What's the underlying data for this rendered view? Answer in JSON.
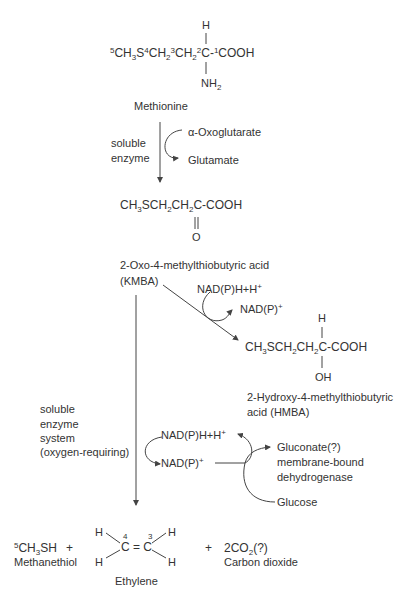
{
  "methionine": {
    "h_top": "H",
    "formula": {
      "l5": "5",
      "p1": "CH",
      "s3": "3",
      "p2": "S",
      "l4": "4",
      "p3": "CH",
      "s2a": "2",
      "l3": "3",
      "p4": "CH",
      "s2b": "2",
      "l2": "2",
      "p5": "C-",
      "l1": "1",
      "p6": "COOH"
    },
    "nh2": {
      "n": "NH",
      "sub": "2"
    },
    "name": "Methionine"
  },
  "step1": {
    "enzyme_line1": "soluble",
    "enzyme_line2": "enzyme",
    "cosubstrate_in": "α-Oxoglutarate",
    "cosubstrate_out": "Glutamate"
  },
  "kmba": {
    "formula": {
      "p1": "CH",
      "s3": "3",
      "p2": "SCH",
      "s2a": "2",
      "p3": "CH",
      "s2b": "2",
      "p4": "C-COOH"
    },
    "oxo": "O",
    "name_line1": "2-Oxo-4-methylthiobutyric acid",
    "name_line2": "(KMBA)"
  },
  "step2": {
    "cofactor_in": {
      "text": "NAD(P)H+H",
      "sup": "+"
    },
    "cofactor_out": {
      "text": "NAD(P)",
      "sup": "+"
    }
  },
  "hmba": {
    "h_top": "H",
    "formula": {
      "p1": "CH",
      "s3": "3",
      "p2": "SCH",
      "s2a": "2",
      "p3": "CH",
      "s2b": "2",
      "p4": "C-COOH"
    },
    "oh": "OH",
    "name_line1": "2-Hydroxy-4-methylthiobutyric",
    "name_line2": "acid (HMBA)"
  },
  "step3": {
    "enzyme_line1": "soluble",
    "enzyme_line2": "enzyme",
    "enzyme_line3": "system",
    "enzyme_line4": "(oxygen-requiring)",
    "cofactor_reduced": {
      "text": "NAD(P)H+H",
      "sup": "+"
    },
    "cofactor_oxidized": {
      "text": "NAD(P)",
      "sup": "+"
    },
    "gluconate": "Gluconate(?)",
    "dehydrogenase_line1": "membrane-bound",
    "dehydrogenase_line2": "dehydrogenase",
    "glucose": "Glucose"
  },
  "products": {
    "methanethiol": {
      "l5": "5",
      "p1": "CH",
      "s3": "3",
      "p2": "SH",
      "name": "Methanethiol"
    },
    "plus1": "+",
    "ethylene": {
      "h": "H",
      "c4_label": "4",
      "c3_label": "3",
      "c_eq_c": "C = C",
      "name": "Ethylene"
    },
    "plus2": "+",
    "co2": {
      "p1": "2CO",
      "s2": "2",
      "p2": "(?)",
      "name": "Carbon dioxide"
    }
  }
}
